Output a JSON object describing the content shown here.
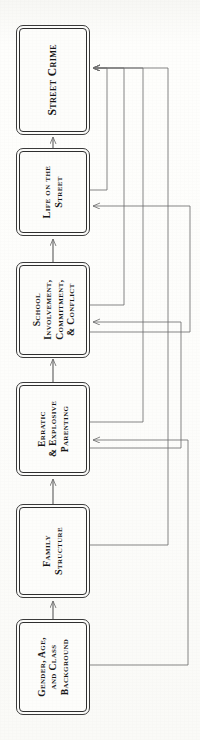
{
  "diagram": {
    "orientation": "rotated-90",
    "nodes": [
      {
        "id": "street-crime",
        "lines": [
          "Street Crime"
        ],
        "x": 16,
        "y": 25,
        "w": 74,
        "h": 110,
        "size": "sz11"
      },
      {
        "id": "life-on-the-street",
        "lines": [
          "Life on the",
          "Street"
        ],
        "x": 16,
        "y": 148,
        "w": 74,
        "h": 88,
        "size": "sz10"
      },
      {
        "id": "school-involvement-commitment-conflict",
        "lines": [
          "School",
          "Involvement,",
          "Commitment,",
          "& Conflict"
        ],
        "x": 16,
        "y": 262,
        "w": 74,
        "h": 96,
        "size": "sz95"
      },
      {
        "id": "erratic-explosive-parenting",
        "lines": [
          "Erratic",
          "& Explosive",
          "Parenting"
        ],
        "x": 16,
        "y": 382,
        "w": 74,
        "h": 94,
        "size": "sz95"
      },
      {
        "id": "family-structure",
        "lines": [
          "Family",
          "Structure"
        ],
        "x": 16,
        "y": 504,
        "w": 74,
        "h": 94,
        "size": "sz10"
      },
      {
        "id": "gender-age-class-background",
        "lines": [
          "Gender, Age,",
          "and Class",
          "Background"
        ],
        "x": 16,
        "y": 619,
        "w": 74,
        "h": 96,
        "size": "sz95"
      }
    ],
    "edges": [
      {
        "from": "gender-age-class-background",
        "to": "family-structure",
        "kind": "direct-forward"
      },
      {
        "from": "family-structure",
        "to": "erratic-explosive-parenting",
        "kind": "direct-forward"
      },
      {
        "from": "erratic-explosive-parenting",
        "to": "school-involvement-commitment-conflict",
        "kind": "direct-forward"
      },
      {
        "from": "school-involvement-commitment-conflict",
        "to": "life-on-the-street",
        "kind": "direct-forward"
      },
      {
        "from": "life-on-the-street",
        "to": "street-crime",
        "kind": "direct-forward"
      },
      {
        "from": "life-on-the-street",
        "to": "street-crime",
        "kind": "bypass"
      },
      {
        "from": "school-involvement-commitment-conflict",
        "to": "street-crime",
        "kind": "bypass"
      },
      {
        "from": "erratic-explosive-parenting",
        "to": "street-crime",
        "kind": "bypass"
      },
      {
        "from": "family-structure",
        "to": "street-crime",
        "kind": "bypass"
      },
      {
        "from": "school-involvement-commitment-conflict",
        "to": "life-on-the-street",
        "kind": "bypass"
      },
      {
        "from": "erratic-explosive-parenting",
        "to": "school-involvement-commitment-conflict",
        "kind": "bypass"
      },
      {
        "from": "gender-age-class-background",
        "to": "erratic-explosive-parenting",
        "kind": "bypass"
      }
    ],
    "colors": {
      "background": "#fdfdfb",
      "node_border": "#2e2e2e",
      "node_fill": "#fdfdfb",
      "text": "#161616",
      "wire": "#6f6f6f"
    }
  }
}
